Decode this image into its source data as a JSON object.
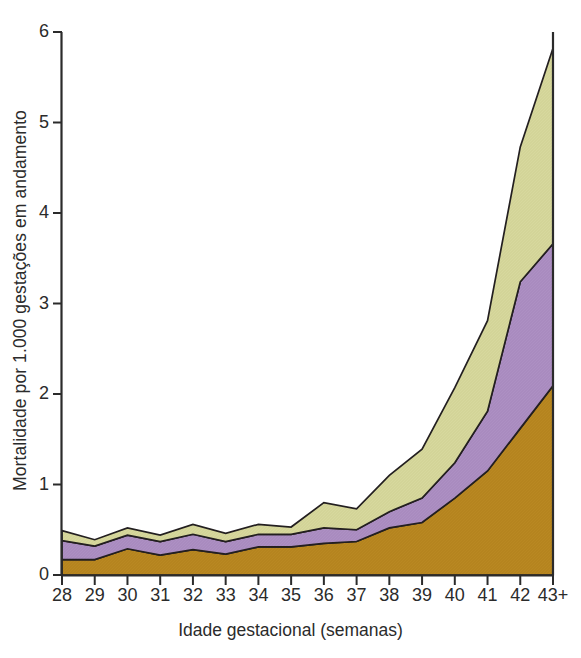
{
  "chart_data": {
    "type": "area",
    "title": "",
    "xlabel": "Idade gestacional (semanas)",
    "ylabel": "Mortalidade por 1.000 gestações em andamento",
    "categories": [
      "28",
      "29",
      "30",
      "31",
      "32",
      "33",
      "34",
      "35",
      "36",
      "37",
      "38",
      "39",
      "40",
      "41",
      "42",
      "43+"
    ],
    "x_tick_labels": [
      "28",
      "29",
      "30",
      "31",
      "32",
      "33",
      "34",
      "35",
      "36",
      "37",
      "38",
      "39",
      "40",
      "41",
      "42",
      "43+"
    ],
    "y_tick_labels": [
      "0",
      "1",
      "2",
      "3",
      "4",
      "5",
      "6"
    ],
    "y_ticks": [
      0,
      1,
      2,
      3,
      4,
      5,
      6
    ],
    "ylim": [
      0,
      6
    ],
    "grid": false,
    "legend": "none",
    "stacked": true,
    "series": [
      {
        "name": "banda-inferior",
        "color": "#b5841f",
        "values": [
          0.17,
          0.17,
          0.29,
          0.22,
          0.28,
          0.23,
          0.31,
          0.31,
          0.35,
          0.37,
          0.52,
          0.58,
          0.85,
          1.15,
          1.62,
          2.09
        ]
      },
      {
        "name": "banda-intermediaria",
        "color": "#a98bbf",
        "values": [
          0.21,
          0.15,
          0.15,
          0.15,
          0.17,
          0.14,
          0.14,
          0.14,
          0.17,
          0.13,
          0.18,
          0.27,
          0.39,
          0.66,
          1.62,
          1.57
        ]
      },
      {
        "name": "banda-superior",
        "color": "#d3d498",
        "values": [
          0.11,
          0.07,
          0.08,
          0.07,
          0.11,
          0.09,
          0.11,
          0.08,
          0.28,
          0.23,
          0.4,
          0.54,
          0.83,
          1.0,
          1.49,
          2.16
        ]
      }
    ],
    "cumulative_totals": [
      0.49,
      0.39,
      0.52,
      0.44,
      0.56,
      0.46,
      0.56,
      0.53,
      0.8,
      0.73,
      1.1,
      1.39,
      2.07,
      2.81,
      4.73,
      5.82
    ]
  },
  "colors": {
    "band_lower": "#b5841f",
    "band_middle": "#a98bbf",
    "band_upper": "#d3d498",
    "axis": "#2b2b2b",
    "outline": "#231f20",
    "background": "#ffffff"
  }
}
